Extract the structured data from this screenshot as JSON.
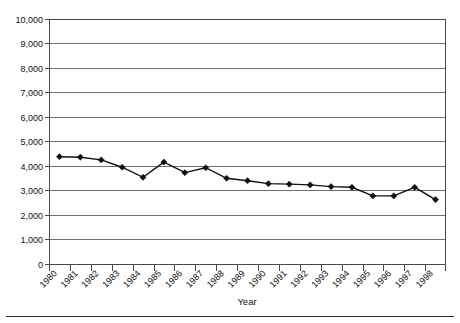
{
  "chart_data": {
    "type": "line",
    "title": "",
    "subtitle": "",
    "xlabel": "Year",
    "ylabel": "",
    "categories": [
      "1980",
      "1981",
      "1982",
      "1983",
      "1984",
      "1985",
      "1986",
      "1987",
      "1988",
      "1989",
      "1990",
      "1991",
      "1992",
      "1993",
      "1994",
      "1995",
      "1996",
      "1997",
      "1998"
    ],
    "values": [
      4400,
      4380,
      4270,
      3970,
      3560,
      4180,
      3750,
      3950,
      3520,
      3420,
      3300,
      3280,
      3250,
      3180,
      3150,
      2800,
      2800,
      3150,
      2650
    ],
    "series": [
      {
        "name": "",
        "values": [
          4400,
          4380,
          4270,
          3970,
          3560,
          4180,
          3750,
          3950,
          3520,
          3420,
          3300,
          3280,
          3250,
          3180,
          3150,
          2800,
          2800,
          3150,
          2650
        ]
      }
    ],
    "ylim": [
      0,
      10000
    ],
    "ytick_values": [
      0,
      1000,
      2000,
      3000,
      4000,
      5000,
      6000,
      7000,
      8000,
      9000,
      10000
    ],
    "ytick_labels": [
      "0",
      "1,000",
      "2,000",
      "3,000",
      "4,000",
      "5,000",
      "6,000",
      "7,000",
      "8,000",
      "9,000",
      "10,000"
    ],
    "grid": true,
    "grid_axis": "y",
    "legend": false,
    "legend_position": "none",
    "marker": "diamond",
    "line_color": "#111111",
    "marker_color": "#111111",
    "grid_color": "#6e6e6e",
    "annotations": []
  },
  "figure": {
    "xaxis_title": "Year",
    "xtick_label_rotation": -45,
    "bottom_rule": true
  }
}
